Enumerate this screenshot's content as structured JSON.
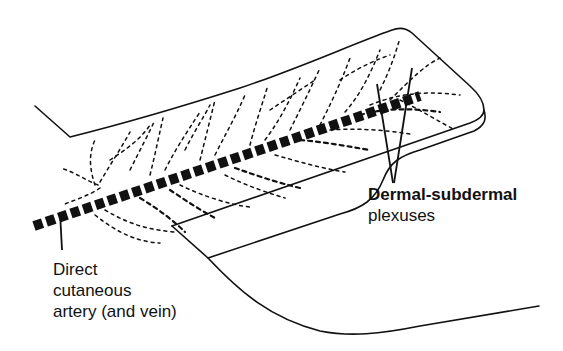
{
  "figure": {
    "labels": {
      "artery": {
        "lines": [
          "Direct",
          "cutaneous",
          "artery (and vein)"
        ]
      },
      "plexus": {
        "lines": [
          "Dermal-subdermal",
          "plexuses"
        ]
      }
    },
    "colors": {
      "ink": "#111111",
      "background": "#ffffff"
    }
  }
}
